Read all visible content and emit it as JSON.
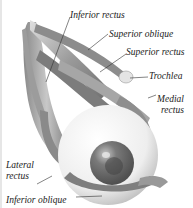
{
  "diagram": {
    "labels": {
      "inferior_rectus": "Inferior rectus",
      "superior_oblique": "Superior oblique",
      "superior_rectus": "Superior rectus",
      "trochlea": "Trochlea",
      "medial_rectus_1": "Medial",
      "medial_rectus_2": "rectus",
      "lateral_rectus_1": "Lateral",
      "lateral_rectus_2": "rectus",
      "inferior_oblique": "Inferior oblique"
    },
    "colors": {
      "muscle": "#9a9a9a",
      "muscle_dark": "#6e6e6e",
      "sclera": "#f2f2f2",
      "iris": "#6a6a6a",
      "pupil": "#3e3e3e",
      "leader": "#333333"
    }
  }
}
